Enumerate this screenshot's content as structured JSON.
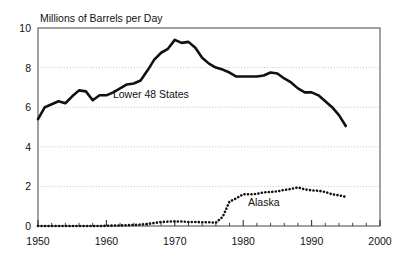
{
  "chart_data": {
    "type": "line",
    "title": "Millions of Barrels per Day",
    "xlabel": "",
    "ylabel": "",
    "xlim": [
      1950,
      2000
    ],
    "ylim": [
      0,
      10
    ],
    "grid": true,
    "grid_style": "dotted-horizontal",
    "legend_position": "inline-annotation",
    "xticks": [
      1950,
      1960,
      1970,
      1980,
      1990,
      2000
    ],
    "xtick_labels": [
      "1950",
      "1960",
      "1970",
      "1980",
      "1990",
      "2000"
    ],
    "xminor_tick_interval": 2,
    "yticks": [
      0,
      2,
      4,
      6,
      8,
      10
    ],
    "ytick_labels": [
      "0",
      "2",
      "4",
      "6",
      "8",
      "10"
    ],
    "annotations": [
      {
        "text": "Lower 48 States",
        "x": 1966.5,
        "y": 6.45
      },
      {
        "text": "Alaska",
        "x": 1983.0,
        "y": 1.02
      }
    ],
    "series": [
      {
        "name": "Lower 48 States",
        "style": "solid",
        "color": "#111111",
        "width": 2.6,
        "x": [
          1950,
          1951,
          1952,
          1953,
          1954,
          1955,
          1956,
          1957,
          1958,
          1959,
          1960,
          1961,
          1962,
          1963,
          1964,
          1965,
          1966,
          1967,
          1968,
          1969,
          1970,
          1971,
          1972,
          1973,
          1974,
          1975,
          1976,
          1977,
          1978,
          1979,
          1980,
          1981,
          1982,
          1983,
          1984,
          1985,
          1986,
          1987,
          1988,
          1989,
          1990,
          1991,
          1992,
          1993,
          1994,
          1995
        ],
        "values": [
          5.4,
          6.0,
          6.15,
          6.3,
          6.2,
          6.55,
          6.85,
          6.8,
          6.35,
          6.6,
          6.6,
          6.75,
          6.95,
          7.15,
          7.2,
          7.35,
          7.85,
          8.4,
          8.75,
          8.95,
          9.4,
          9.25,
          9.3,
          9.0,
          8.5,
          8.2,
          8.0,
          7.9,
          7.75,
          7.55,
          7.55,
          7.55,
          7.55,
          7.6,
          7.75,
          7.7,
          7.45,
          7.25,
          6.95,
          6.75,
          6.75,
          6.6,
          6.3,
          6.0,
          5.6,
          5.05
        ]
      },
      {
        "name": "Alaska",
        "style": "dotted",
        "color": "#111111",
        "width": 2.6,
        "x": [
          1950,
          1955,
          1959,
          1960,
          1961,
          1962,
          1963,
          1964,
          1965,
          1966,
          1967,
          1968,
          1969,
          1970,
          1971,
          1972,
          1973,
          1974,
          1975,
          1976,
          1977,
          1978,
          1979,
          1980,
          1981,
          1982,
          1983,
          1984,
          1985,
          1986,
          1987,
          1988,
          1989,
          1990,
          1991,
          1992,
          1993,
          1994,
          1995
        ],
        "values": [
          0.0,
          0.0,
          0.0,
          0.01,
          0.02,
          0.03,
          0.04,
          0.05,
          0.07,
          0.1,
          0.15,
          0.2,
          0.22,
          0.23,
          0.23,
          0.2,
          0.2,
          0.19,
          0.19,
          0.17,
          0.46,
          1.23,
          1.4,
          1.6,
          1.6,
          1.62,
          1.7,
          1.72,
          1.75,
          1.82,
          1.87,
          1.95,
          1.85,
          1.8,
          1.78,
          1.72,
          1.6,
          1.55,
          1.47
        ]
      }
    ]
  },
  "axes": {
    "top_border": true,
    "right_border": true,
    "left_border": true,
    "bottom_border": true
  }
}
